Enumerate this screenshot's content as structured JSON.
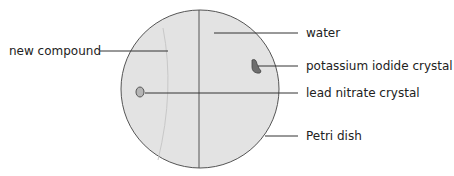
{
  "diagram": {
    "labels": {
      "new_compound": "new compound",
      "water": "water",
      "potassium_iodide": "potassium iodide crystal",
      "lead_nitrate": "lead nitrate crystal",
      "petri_dish": "Petri dish"
    },
    "colors": {
      "dish_fill": "#e3e3e3",
      "outline": "#555555",
      "crystal_ki": "#6e6e6e",
      "crystal_pbno3": "#b5b5b5"
    }
  }
}
